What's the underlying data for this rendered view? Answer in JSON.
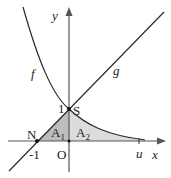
{
  "diagram": {
    "axes": {
      "x_label": "x",
      "y_label": "y",
      "origin_label": "O"
    },
    "curves": [
      {
        "name": "f",
        "label": "f",
        "description": "decreasing exponential through S"
      },
      {
        "name": "g",
        "label": "g",
        "description": "line through N and S"
      }
    ],
    "points": {
      "S": {
        "label": "S",
        "y_tick": "1"
      },
      "N": {
        "label": "N",
        "x_tick": "-1"
      },
      "u": {
        "label": "u"
      }
    },
    "regions": [
      {
        "name": "A1",
        "base": "A",
        "sub": "1",
        "color": "#b8b8b8"
      },
      {
        "name": "A2",
        "base": "A",
        "sub": "2",
        "color": "#d9d9d9"
      }
    ],
    "colors": {
      "curve": "#2a2a2a",
      "axis": "#555555"
    }
  }
}
